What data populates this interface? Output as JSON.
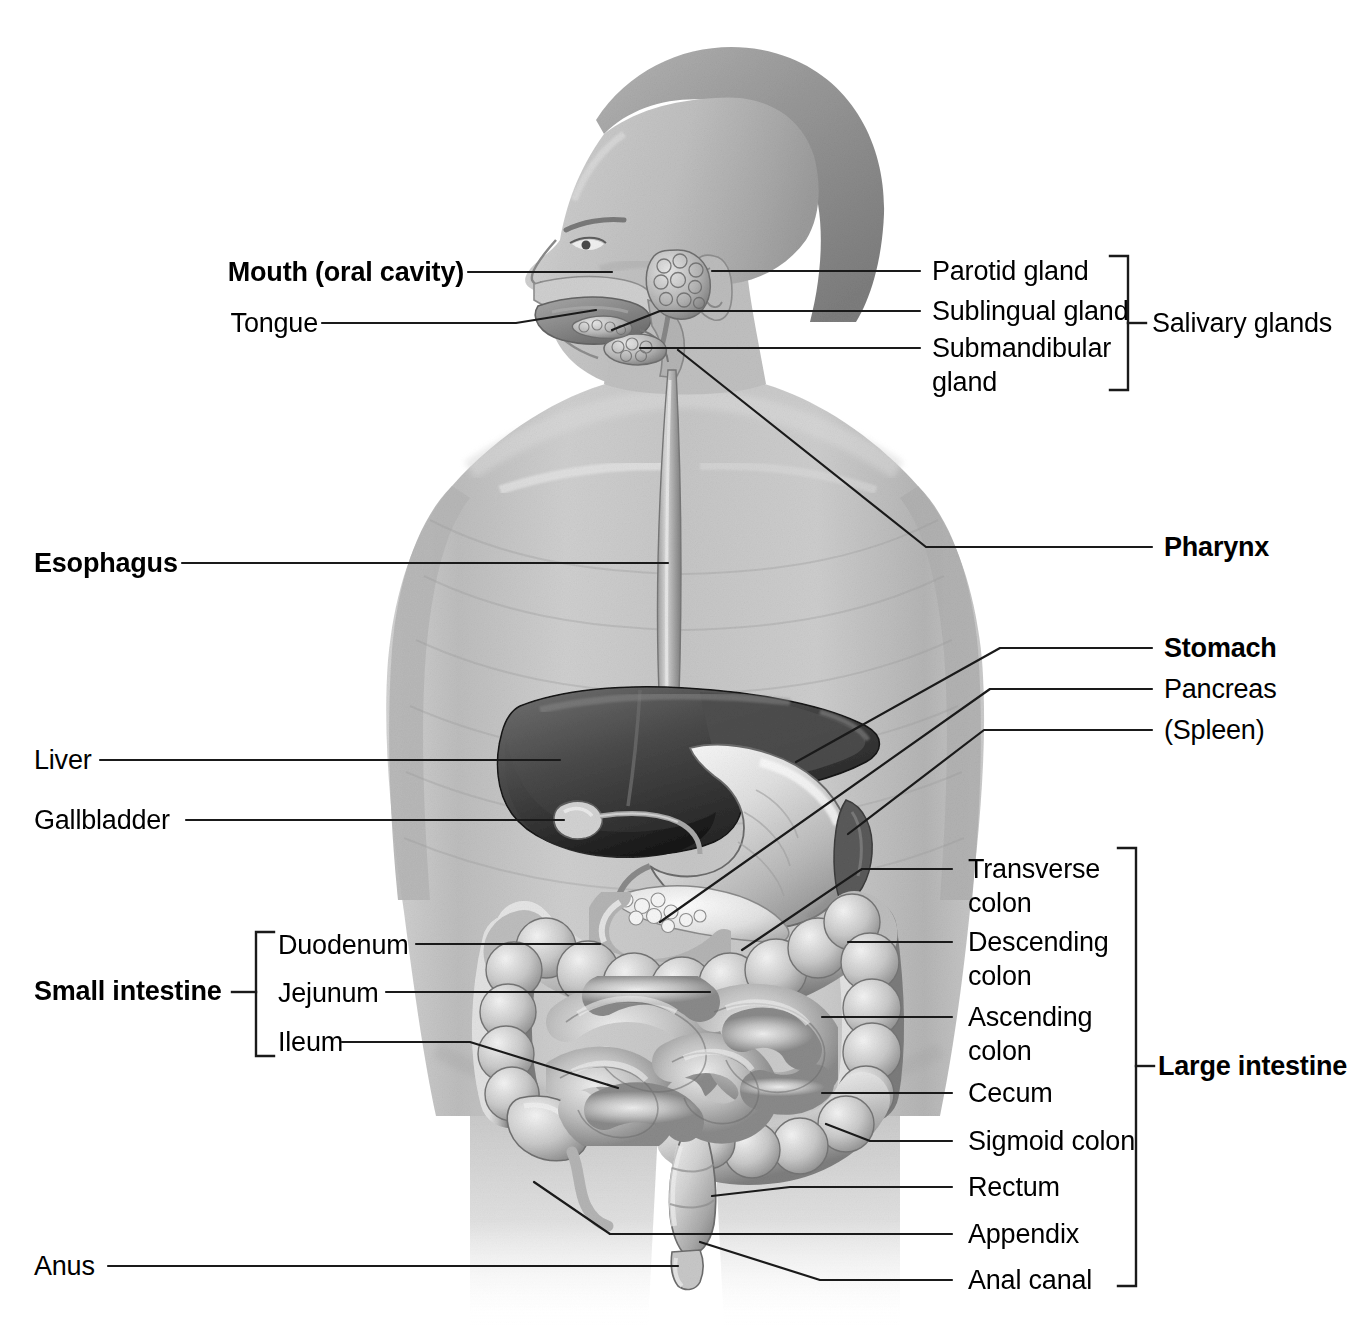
{
  "figure": {
    "view": "anterior view of male torso, head in left profile",
    "style": "grayscale halftone medical illustration with leader lines",
    "background_color": "#ffffff",
    "line_color": "#1a1a1a",
    "text_color": "#000000"
  },
  "labels": {
    "mouth": "Mouth (oral cavity)",
    "tongue": "Tongue",
    "esophagus": "Esophagus",
    "liver": "Liver",
    "gallbladder": "Gallbladder",
    "anus": "Anus",
    "parotid_gland": "Parotid gland",
    "sublingual_gland": "Sublingual gland",
    "submandibular_gland": "Submandibular\ngland",
    "salivary_glands": "Salivary glands",
    "pharynx": "Pharynx",
    "stomach": "Stomach",
    "pancreas": "Pancreas",
    "spleen": "(Spleen)",
    "small_intestine": "Small intestine",
    "duodenum": "Duodenum",
    "jejunum": "Jejunum",
    "ileum": "Ileum",
    "transverse_colon": "Transverse\ncolon",
    "descending_colon": "Descending\ncolon",
    "ascending_colon": "Ascending\ncolon",
    "cecum": "Cecum",
    "sigmoid_colon": "Sigmoid colon",
    "rectum": "Rectum",
    "appendix": "Appendix",
    "anal_canal": "Anal canal",
    "large_intestine": "Large intestine"
  },
  "groups": {
    "salivary_glands_members": [
      "Parotid gland",
      "Sublingual gland",
      "Submandibular gland"
    ],
    "small_intestine_members": [
      "Duodenum",
      "Jejunum",
      "Ileum"
    ],
    "large_intestine_members": [
      "Transverse colon",
      "Descending colon",
      "Ascending colon",
      "Cecum",
      "Sigmoid colon",
      "Rectum",
      "Appendix",
      "Anal canal"
    ]
  },
  "emphasis": {
    "bold_labels": [
      "Mouth (oral cavity)",
      "Esophagus",
      "Pharynx",
      "Stomach",
      "Small intestine",
      "Large intestine"
    ],
    "plain_labels": [
      "Tongue",
      "Parotid gland",
      "Sublingual gland",
      "Submandibular gland",
      "Salivary glands",
      "Pancreas",
      "(Spleen)",
      "Liver",
      "Gallbladder",
      "Duodenum",
      "Jejunum",
      "Ileum",
      "Transverse colon",
      "Descending colon",
      "Ascending colon",
      "Cecum",
      "Sigmoid colon",
      "Rectum",
      "Appendix",
      "Anal canal",
      "Anus"
    ]
  }
}
